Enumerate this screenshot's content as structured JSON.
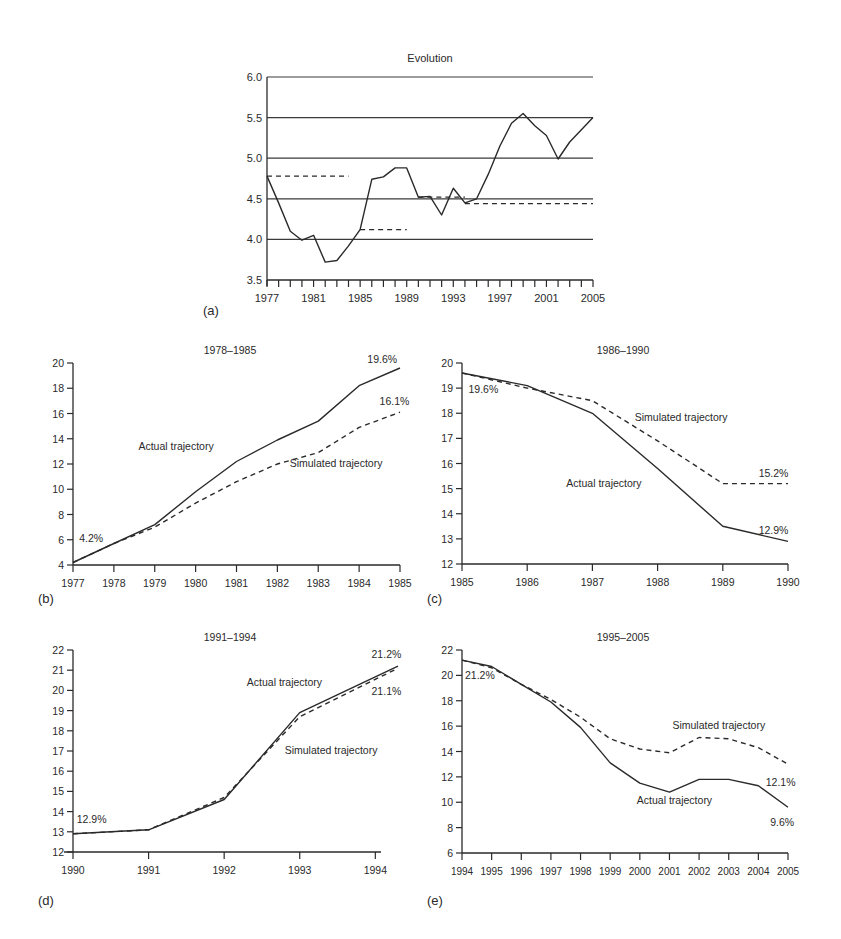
{
  "figure": {
    "panel_letters": [
      "(a)",
      "(b)",
      "(c)",
      "(d)",
      "(e)"
    ],
    "ink_color": "#2a2a2a",
    "grid_color": "#3a3a3a"
  },
  "chart_data": [
    {
      "id": "a",
      "type": "line",
      "title": "Evolution",
      "panel_label": "(a)",
      "xlabel": "",
      "ylabel": "",
      "xlim": [
        1977,
        2005
      ],
      "ylim": [
        3.5,
        6.0
      ],
      "grid": "horizontal",
      "x_ticks": [
        1977,
        1981,
        1985,
        1989,
        1993,
        1997,
        2001,
        2005
      ],
      "minor_x_ticks_every": 1,
      "y_ticks": [
        "3.5",
        "4.0",
        "4.5",
        "5.0",
        "5.5",
        "6.0"
      ],
      "y_tick_values": [
        3.5,
        4.0,
        4.5,
        5.0,
        5.5,
        6.0
      ],
      "series": [
        {
          "name": "Evolution",
          "style": "solid",
          "x": [
            1977,
            1978,
            1979,
            1980,
            1981,
            1982,
            1983,
            1984,
            1985,
            1986,
            1987,
            1988,
            1989,
            1990,
            1991,
            1992,
            1993,
            1994,
            1995,
            1996,
            1997,
            1998,
            1999,
            2000,
            2001,
            2002,
            2003,
            2004,
            2005
          ],
          "values": [
            4.78,
            4.45,
            4.1,
            3.99,
            4.05,
            3.72,
            3.74,
            3.92,
            4.12,
            4.74,
            4.77,
            4.88,
            4.88,
            4.52,
            4.53,
            4.3,
            4.63,
            4.45,
            4.5,
            4.8,
            5.15,
            5.43,
            5.55,
            5.4,
            5.28,
            4.99,
            5.2,
            5.35,
            5.5
          ]
        }
      ],
      "period_means": [
        {
          "name": "1977-1984 mean",
          "style": "dashed",
          "x": [
            1977,
            1984
          ],
          "values": [
            4.78,
            4.78
          ]
        },
        {
          "name": "1985-1989 mean",
          "style": "dashed",
          "x": [
            1985,
            1989
          ],
          "values": [
            4.12,
            4.12
          ]
        },
        {
          "name": "1990-1994 mean",
          "style": "dashed",
          "x": [
            1990,
            1994
          ],
          "values": [
            4.52,
            4.52
          ]
        },
        {
          "name": "1994-2005 mean",
          "style": "dashed",
          "x": [
            1994,
            2005
          ],
          "values": [
            4.44,
            4.44
          ]
        }
      ],
      "annotations": []
    },
    {
      "id": "b",
      "type": "line",
      "title": "1978–1985",
      "panel_label": "(b)",
      "xlabel": "",
      "ylabel": "",
      "xlim": [
        1977,
        1985
      ],
      "ylim": [
        4,
        20
      ],
      "grid": "none",
      "x_ticks": [
        1977,
        1978,
        1979,
        1980,
        1981,
        1982,
        1983,
        1984,
        1985
      ],
      "y_ticks": [
        "4",
        "6",
        "8",
        "10",
        "12",
        "14",
        "16",
        "18",
        "20"
      ],
      "y_tick_values": [
        4,
        6,
        8,
        10,
        12,
        14,
        16,
        18,
        20
      ],
      "series": [
        {
          "name": "Actual trajectory",
          "style": "solid",
          "x": [
            1977,
            1978,
            1979,
            1980,
            1981,
            1982,
            1983,
            1984,
            1985
          ],
          "values": [
            4.2,
            5.7,
            7.2,
            9.8,
            12.2,
            13.9,
            15.4,
            18.2,
            19.6
          ]
        },
        {
          "name": "Simulated trajectory",
          "style": "dashed",
          "x": [
            1977,
            1978,
            1979,
            1980,
            1981,
            1982,
            1983,
            1984,
            1985
          ],
          "values": [
            4.2,
            5.7,
            7.0,
            8.9,
            10.6,
            12.0,
            12.9,
            14.9,
            16.1
          ]
        }
      ],
      "annotations": [
        {
          "text": "4.2%",
          "x": 1977.15,
          "y": 5.8
        },
        {
          "text": "19.6%",
          "x": 1984.2,
          "y": 20.0
        },
        {
          "text": "16.1%",
          "x": 1984.5,
          "y": 16.7
        },
        {
          "text": "Actual trajectory",
          "x": 1978.6,
          "y": 13.1
        },
        {
          "text": "Simulated trajectory",
          "x": 1982.3,
          "y": 11.8
        }
      ]
    },
    {
      "id": "c",
      "type": "line",
      "title": "1986–1990",
      "panel_label": "(c)",
      "xlabel": "",
      "ylabel": "",
      "xlim": [
        1985,
        1990
      ],
      "ylim": [
        12,
        20
      ],
      "grid": "none",
      "x_ticks": [
        1985,
        1986,
        1987,
        1988,
        1989,
        1990
      ],
      "y_ticks": [
        "12",
        "13",
        "14",
        "15",
        "16",
        "17",
        "18",
        "19",
        "20"
      ],
      "y_tick_values": [
        12,
        13,
        14,
        15,
        16,
        17,
        18,
        19,
        20
      ],
      "series": [
        {
          "name": "Actual trajectory",
          "style": "solid",
          "x": [
            1985,
            1986,
            1987,
            1988,
            1989,
            1990
          ],
          "values": [
            19.6,
            19.1,
            18.0,
            15.8,
            13.5,
            12.9
          ]
        },
        {
          "name": "Simulated trajectory",
          "style": "dashed",
          "x": [
            1985,
            1986,
            1987,
            1988,
            1989,
            1990
          ],
          "values": [
            19.6,
            19.0,
            18.5,
            16.9,
            15.2,
            15.2
          ]
        }
      ],
      "annotations": [
        {
          "text": "19.6%",
          "x": 1985.1,
          "y": 18.8
        },
        {
          "text": "Simulated trajectory",
          "x": 1987.65,
          "y": 17.7
        },
        {
          "text": "15.2%",
          "x": 1989.55,
          "y": 15.45
        },
        {
          "text": "Actual trajectory",
          "x": 1986.6,
          "y": 15.05
        },
        {
          "text": "12.9%",
          "x": 1989.55,
          "y": 13.2
        }
      ]
    },
    {
      "id": "d",
      "type": "line",
      "title": "1991–1994",
      "panel_label": "(d)",
      "xlabel": "",
      "ylabel": "",
      "xlim": [
        1990,
        1994.3
      ],
      "ylim": [
        12,
        22
      ],
      "grid": "none",
      "x_ticks": [
        1990,
        1991,
        1992,
        1993,
        1994
      ],
      "y_ticks": [
        "12",
        "13",
        "14",
        "15",
        "16",
        "17",
        "18",
        "19",
        "20",
        "21",
        "22"
      ],
      "y_tick_values": [
        12,
        13,
        14,
        15,
        16,
        17,
        18,
        19,
        20,
        21,
        22
      ],
      "series": [
        {
          "name": "Actual trajectory",
          "style": "solid",
          "x": [
            1990,
            1991,
            1992,
            1993,
            1994.3
          ],
          "values": [
            12.9,
            13.1,
            14.6,
            18.9,
            21.2
          ]
        },
        {
          "name": "Simulated trajectory",
          "style": "dashed",
          "x": [
            1990,
            1991,
            1992,
            1993,
            1994.3
          ],
          "values": [
            12.9,
            13.1,
            14.7,
            18.7,
            21.1
          ]
        }
      ],
      "annotations": [
        {
          "text": "12.9%",
          "x": 1990.05,
          "y": 13.45
        },
        {
          "text": "Actual trajectory",
          "x": 1992.3,
          "y": 20.2
        },
        {
          "text": "21.2%",
          "x": 1993.95,
          "y": 21.6
        },
        {
          "text": "21.1%",
          "x": 1993.95,
          "y": 19.75
        },
        {
          "text": "Simulated trajectory",
          "x": 1992.8,
          "y": 16.85
        }
      ]
    },
    {
      "id": "e",
      "type": "line",
      "title": "1995–2005",
      "panel_label": "(e)",
      "xlabel": "",
      "ylabel": "",
      "xlim": [
        1994,
        2005
      ],
      "ylim": [
        6,
        22
      ],
      "grid": "none",
      "x_ticks": [
        1994,
        1995,
        1996,
        1997,
        1998,
        1999,
        2000,
        2001,
        2002,
        2003,
        2004,
        2005
      ],
      "y_ticks": [
        "6",
        "8",
        "10",
        "12",
        "14",
        "16",
        "18",
        "20",
        "22"
      ],
      "y_tick_values": [
        6,
        8,
        10,
        12,
        14,
        16,
        18,
        20,
        22
      ],
      "series": [
        {
          "name": "Actual trajectory",
          "style": "solid",
          "x": [
            1994,
            1995,
            1996,
            1997,
            1998,
            1999,
            2000,
            2001,
            2002,
            2003,
            2004,
            2005
          ],
          "values": [
            21.2,
            20.7,
            19.3,
            17.9,
            15.9,
            13.1,
            11.5,
            10.8,
            11.8,
            11.8,
            11.3,
            9.6
          ]
        },
        {
          "name": "Simulated trajectory",
          "style": "dashed",
          "x": [
            1994,
            1995,
            1996,
            1997,
            1998,
            1999,
            2000,
            2001,
            2002,
            2003,
            2004,
            2005
          ],
          "values": [
            21.2,
            20.6,
            19.3,
            18.1,
            16.7,
            15.0,
            14.2,
            13.9,
            15.1,
            15.0,
            14.3,
            13.0
          ]
        }
      ],
      "annotations": [
        {
          "text": "21.2%",
          "x": 1994.1,
          "y": 19.7
        },
        {
          "text": "Simulated trajectory",
          "x": 2001.1,
          "y": 15.8
        },
        {
          "text": "12.1%",
          "x": 2004.25,
          "y": 11.3
        },
        {
          "text": "Actual trajectory",
          "x": 1999.9,
          "y": 9.9
        },
        {
          "text": "9.6%",
          "x": 2004.4,
          "y": 8.1
        }
      ]
    }
  ]
}
